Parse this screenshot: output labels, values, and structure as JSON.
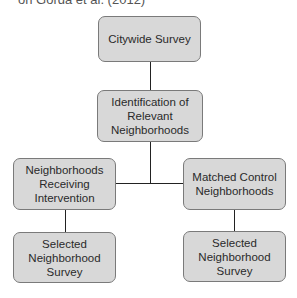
{
  "header": {
    "text": "on Gorda et al. (2012)"
  },
  "diagram": {
    "type": "flowchart",
    "colors": {
      "box_fill": "#d8d8d8",
      "box_border": "#7a7a7a",
      "line": "#222222"
    },
    "nodes": {
      "citywide": {
        "label": "Citywide Survey"
      },
      "identification": {
        "label": "Identification of Relevant Neighborhoods"
      },
      "intervention": {
        "label": "Neighborhoods Receiving Intervention"
      },
      "control": {
        "label": "Matched Control Neighborhoods"
      },
      "survey_left": {
        "label": "Selected Neighborhood Survey"
      },
      "survey_right": {
        "label": "Selected Neighborhood Survey"
      }
    },
    "edges": [
      [
        "Citywide Survey",
        "Identification of Relevant Neighborhoods"
      ],
      [
        "Identification of Relevant Neighborhoods",
        "Neighborhoods Receiving Intervention"
      ],
      [
        "Identification of Relevant Neighborhoods",
        "Matched Control Neighborhoods"
      ],
      [
        "Neighborhoods Receiving Intervention",
        "Selected Neighborhood Survey"
      ],
      [
        "Matched Control Neighborhoods",
        "Selected Neighborhood Survey"
      ]
    ]
  }
}
